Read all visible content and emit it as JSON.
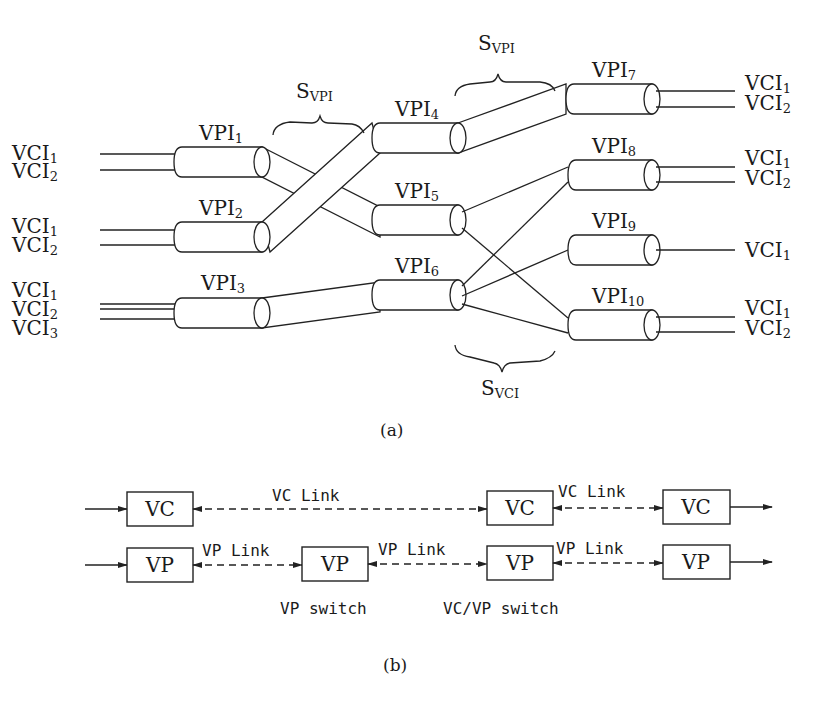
{
  "part_a": {
    "caption": "(a)",
    "inputs": [
      {
        "group": "VPI1",
        "vcis": [
          "VCI1",
          "VCI2"
        ]
      },
      {
        "group": "VPI2",
        "vcis": [
          "VCI1",
          "VCI2"
        ]
      },
      {
        "group": "VPI3",
        "vcis": [
          "VCI1",
          "VCI2",
          "VCI3"
        ]
      }
    ],
    "vpi_labels": {
      "vpi1": {
        "base": "VPI",
        "sub": "1"
      },
      "vpi2": {
        "base": "VPI",
        "sub": "2"
      },
      "vpi3": {
        "base": "VPI",
        "sub": "3"
      },
      "vpi4": {
        "base": "VPI",
        "sub": "4"
      },
      "vpi5": {
        "base": "VPI",
        "sub": "5"
      },
      "vpi6": {
        "base": "VPI",
        "sub": "6"
      },
      "vpi7": {
        "base": "VPI",
        "sub": "7"
      },
      "vpi8": {
        "base": "VPI",
        "sub": "8"
      },
      "vpi9": {
        "base": "VPI",
        "sub": "9"
      },
      "vpi10": {
        "base": "VPI",
        "sub": "10"
      }
    },
    "vci_label_base": "VCI",
    "vci_subs": [
      "1",
      "2",
      "3"
    ],
    "switch_labels": {
      "svpi_left": {
        "base": "S",
        "sub": "VPI"
      },
      "svpi_right": {
        "base": "S",
        "sub": "VPI"
      },
      "svci": {
        "base": "S",
        "sub": "VCI"
      }
    },
    "outputs": [
      {
        "group": "VPI7",
        "vcis": [
          "VCI1",
          "VCI2"
        ]
      },
      {
        "group": "VPI8",
        "vcis": [
          "VCI1",
          "VCI2"
        ]
      },
      {
        "group": "VPI9",
        "vcis": [
          "VCI1"
        ]
      },
      {
        "group": "VPI10",
        "vcis": [
          "VCI1",
          "VCI2"
        ]
      }
    ]
  },
  "part_b": {
    "caption": "(b)",
    "vc_row": {
      "nodes": [
        "VC",
        "VC",
        "VC"
      ],
      "links": [
        "VC Link",
        "VC Link"
      ]
    },
    "vp_row": {
      "nodes": [
        "VP",
        "VP",
        "VP",
        "VP"
      ],
      "links": [
        "VP Link",
        "VP Link",
        "VP Link"
      ]
    },
    "switch_labels": [
      "VP switch",
      "VC/VP switch"
    ]
  }
}
